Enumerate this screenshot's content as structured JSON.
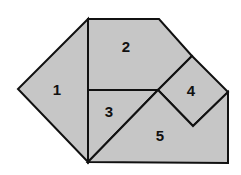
{
  "diagram": {
    "fill_color": "#c6c6c6",
    "stroke_color": "#111111",
    "pieces": [
      {
        "id": "1",
        "label": "1",
        "points": "88,19 18,89 88,162",
        "label_pos": [
          57,
          95
        ]
      },
      {
        "id": "2",
        "label": "2",
        "points": "88,19 159,19 192,56 158,90 88,90",
        "label_pos": [
          126,
          52
        ]
      },
      {
        "id": "3",
        "label": "3",
        "points": "88,90 158,90 88,162",
        "label_pos": [
          109,
          117
        ]
      },
      {
        "id": "4",
        "label": "4",
        "points": "192,56 228,92 193,126 158,90",
        "label_pos": [
          191,
          96
        ]
      },
      {
        "id": "5",
        "label": "5",
        "points": "158,90 193,126 228,92 228,163 88,162",
        "label_pos": [
          160,
          141
        ]
      }
    ]
  }
}
